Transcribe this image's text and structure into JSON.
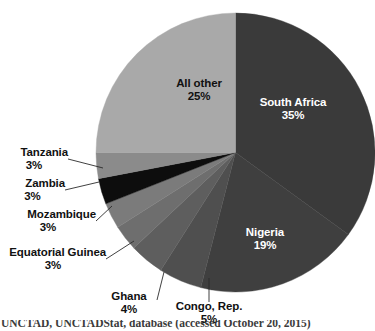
{
  "chart_data": {
    "type": "pie",
    "title": "",
    "subtitle": "",
    "xlabel": "",
    "ylabel": "",
    "legend_position": "none",
    "grid": false,
    "units": "percent",
    "total": 100,
    "start_angle_deg": 0,
    "direction": "clockwise",
    "categories": [
      "South Africa",
      "Nigeria",
      "Congo, Rep.",
      "Ghana",
      "Equatorial Guinea",
      "Mozambique",
      "Zambia",
      "Tanzania",
      "All other"
    ],
    "values": [
      35,
      19,
      5,
      4,
      3,
      3,
      3,
      3,
      25
    ],
    "colors": [
      "#3a3a3a",
      "#3f3f3f",
      "#4f4f4f",
      "#5e5e5e",
      "#6e6e6e",
      "#7b7b7b",
      "#0d0d0d",
      "#8b8b8b",
      "#a9a9a9"
    ],
    "slices": [
      {
        "name": "South Africa",
        "value": 35,
        "label": "South Africa",
        "percent_label": "35%",
        "color": "#3a3a3a",
        "label_placement": "inside",
        "label_color": "#ffffff"
      },
      {
        "name": "Nigeria",
        "value": 19,
        "label": "Nigeria",
        "percent_label": "19%",
        "color": "#3f3f3f",
        "label_placement": "inside",
        "label_color": "#ffffff"
      },
      {
        "name": "Congo, Rep.",
        "value": 5,
        "label": "Congo, Rep.",
        "percent_label": "5%",
        "color": "#4f4f4f",
        "label_placement": "outside",
        "label_color": "#111111"
      },
      {
        "name": "Ghana",
        "value": 4,
        "label": "Ghana",
        "percent_label": "4%",
        "color": "#5e5e5e",
        "label_placement": "outside",
        "label_color": "#111111"
      },
      {
        "name": "Equatorial Guinea",
        "value": 3,
        "label": "Equatorial Guinea",
        "percent_label": "3%",
        "color": "#6e6e6e",
        "label_placement": "outside",
        "label_color": "#111111"
      },
      {
        "name": "Mozambique",
        "value": 3,
        "label": "Mozambique",
        "percent_label": "3%",
        "color": "#7b7b7b",
        "label_placement": "outside",
        "label_color": "#111111"
      },
      {
        "name": "Zambia",
        "value": 3,
        "label": "Zambia",
        "percent_label": "3%",
        "color": "#0d0d0d",
        "label_placement": "outside",
        "label_color": "#111111"
      },
      {
        "name": "Tanzania",
        "value": 3,
        "label": "Tanzania",
        "percent_label": "3%",
        "color": "#8b8b8b",
        "label_placement": "outside",
        "label_color": "#111111"
      },
      {
        "name": "All other",
        "value": 25,
        "label": "All other",
        "percent_label": "25%",
        "color": "#a9a9a9",
        "label_placement": "inside",
        "label_color": "#111111"
      }
    ]
  },
  "caption": {
    "text": "UNCTAD, UNCTADStat, database (accessed October 20, 2015)"
  }
}
